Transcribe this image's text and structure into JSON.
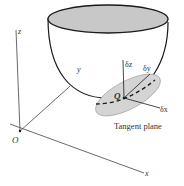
{
  "figure": {
    "labels": {
      "z_axis": "z",
      "y_axis": "y",
      "x_axis": "x",
      "origin": "O",
      "point": "Q",
      "delta_z": "δz",
      "delta_y": "δy",
      "delta_x": "δx",
      "tangent_plane": "Tangent plane"
    },
    "caption": "Fig. 24.3"
  },
  "colors": {
    "bowl_top_fill": "#c8c8c8",
    "tangent_plane_fill": "#d4d4d4",
    "line": "#1a1a1a",
    "axis": "#444444"
  }
}
